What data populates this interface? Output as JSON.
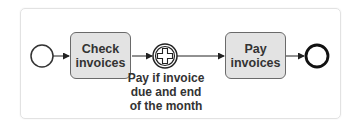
{
  "diagram": {
    "type": "BPMN process",
    "nodes": [
      {
        "id": "start",
        "kind": "start-event"
      },
      {
        "id": "check",
        "kind": "task",
        "label": "Check\ninvoices"
      },
      {
        "id": "wait",
        "kind": "intermediate-event-parallel-multiple",
        "label": "Pay if invoice\ndue and end\nof the month"
      },
      {
        "id": "pay",
        "kind": "task",
        "label": "Pay\ninvoices"
      },
      {
        "id": "end",
        "kind": "end-event"
      }
    ],
    "edges": [
      [
        "start",
        "check"
      ],
      [
        "check",
        "wait"
      ],
      [
        "wait",
        "pay"
      ],
      [
        "pay",
        "end"
      ]
    ],
    "colors": {
      "task_fill": "#e3e3e3",
      "stroke": "#222222"
    }
  }
}
